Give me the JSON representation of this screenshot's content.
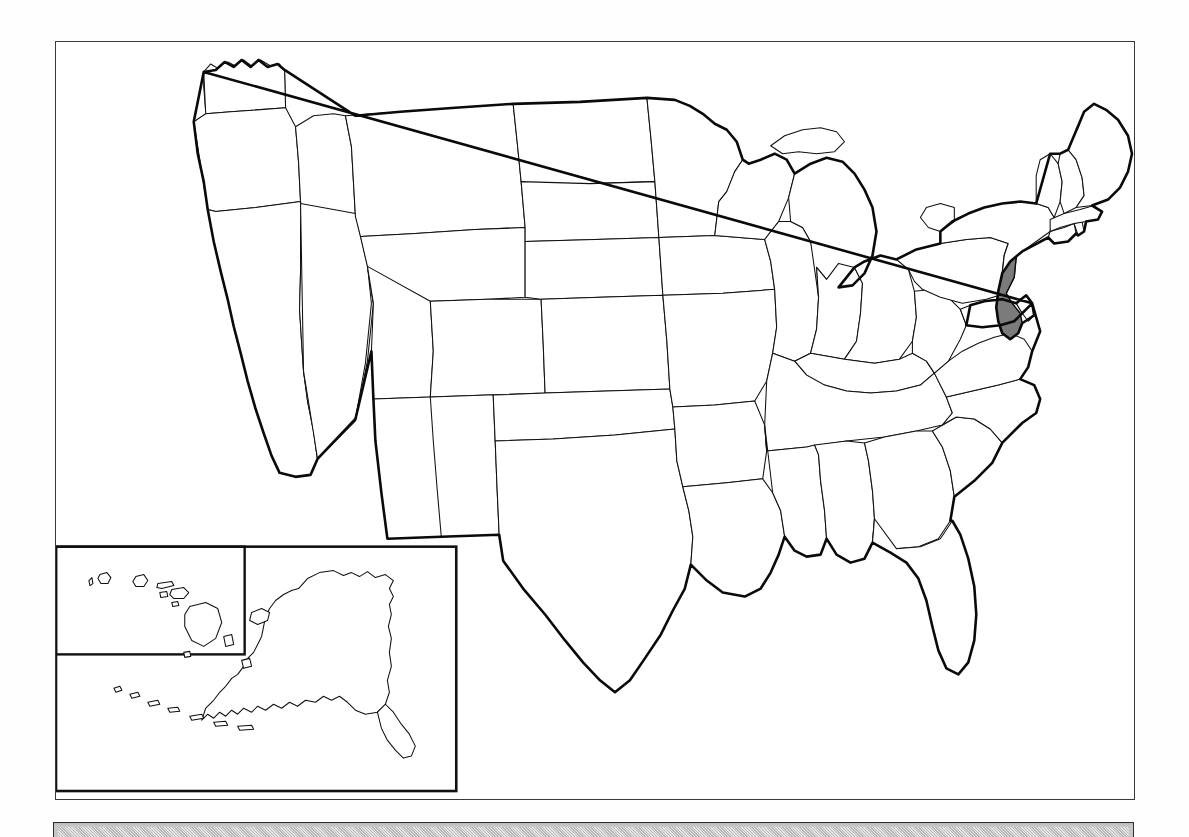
{
  "document": {
    "type": "outline-map",
    "title": "United States Outline Map",
    "subject": "New Jersey",
    "background_color": "#fefefe"
  },
  "map": {
    "frame": {
      "border_color": "#3a3a3a",
      "fill_color": "#ffffff"
    },
    "outline_color": "#0a0a0a",
    "state_fill_color": "#ffffff",
    "highlight_color": "#7b7b7b",
    "highlighted_states": [
      "New Jersey"
    ],
    "projection_note": "contiguous 48 states with Alaska and Hawaii inset",
    "regions": [
      {
        "id": "WA",
        "name": "Washington",
        "highlighted": false
      },
      {
        "id": "OR",
        "name": "Oregon",
        "highlighted": false
      },
      {
        "id": "CA",
        "name": "California",
        "highlighted": false
      },
      {
        "id": "ID",
        "name": "Idaho",
        "highlighted": false
      },
      {
        "id": "NV",
        "name": "Nevada",
        "highlighted": false
      },
      {
        "id": "MT",
        "name": "Montana",
        "highlighted": false
      },
      {
        "id": "WY",
        "name": "Wyoming",
        "highlighted": false
      },
      {
        "id": "UT",
        "name": "Utah",
        "highlighted": false
      },
      {
        "id": "AZ",
        "name": "Arizona",
        "highlighted": false
      },
      {
        "id": "CO",
        "name": "Colorado",
        "highlighted": false
      },
      {
        "id": "NM",
        "name": "New Mexico",
        "highlighted": false
      },
      {
        "id": "ND",
        "name": "North Dakota",
        "highlighted": false
      },
      {
        "id": "SD",
        "name": "South Dakota",
        "highlighted": false
      },
      {
        "id": "NE",
        "name": "Nebraska",
        "highlighted": false
      },
      {
        "id": "KS",
        "name": "Kansas",
        "highlighted": false
      },
      {
        "id": "OK",
        "name": "Oklahoma",
        "highlighted": false
      },
      {
        "id": "TX",
        "name": "Texas",
        "highlighted": false
      },
      {
        "id": "MN",
        "name": "Minnesota",
        "highlighted": false
      },
      {
        "id": "IA",
        "name": "Iowa",
        "highlighted": false
      },
      {
        "id": "MO",
        "name": "Missouri",
        "highlighted": false
      },
      {
        "id": "AR",
        "name": "Arkansas",
        "highlighted": false
      },
      {
        "id": "LA",
        "name": "Louisiana",
        "highlighted": false
      },
      {
        "id": "WI",
        "name": "Wisconsin",
        "highlighted": false
      },
      {
        "id": "IL",
        "name": "Illinois",
        "highlighted": false
      },
      {
        "id": "MI",
        "name": "Michigan",
        "highlighted": false
      },
      {
        "id": "IN",
        "name": "Indiana",
        "highlighted": false
      },
      {
        "id": "OH",
        "name": "Ohio",
        "highlighted": false
      },
      {
        "id": "KY",
        "name": "Kentucky",
        "highlighted": false
      },
      {
        "id": "TN",
        "name": "Tennessee",
        "highlighted": false
      },
      {
        "id": "MS",
        "name": "Mississippi",
        "highlighted": false
      },
      {
        "id": "AL",
        "name": "Alabama",
        "highlighted": false
      },
      {
        "id": "GA",
        "name": "Georgia",
        "highlighted": false
      },
      {
        "id": "FL",
        "name": "Florida",
        "highlighted": false
      },
      {
        "id": "SC",
        "name": "South Carolina",
        "highlighted": false
      },
      {
        "id": "NC",
        "name": "North Carolina",
        "highlighted": false
      },
      {
        "id": "VA",
        "name": "Virginia",
        "highlighted": false
      },
      {
        "id": "WV",
        "name": "West Virginia",
        "highlighted": false
      },
      {
        "id": "MD",
        "name": "Maryland",
        "highlighted": false
      },
      {
        "id": "DE",
        "name": "Delaware",
        "highlighted": false
      },
      {
        "id": "PA",
        "name": "Pennsylvania",
        "highlighted": false
      },
      {
        "id": "NJ",
        "name": "New Jersey",
        "highlighted": true
      },
      {
        "id": "NY",
        "name": "New York",
        "highlighted": false
      },
      {
        "id": "CT",
        "name": "Connecticut",
        "highlighted": false
      },
      {
        "id": "RI",
        "name": "Rhode Island",
        "highlighted": false
      },
      {
        "id": "MA",
        "name": "Massachusetts",
        "highlighted": false
      },
      {
        "id": "VT",
        "name": "Vermont",
        "highlighted": false
      },
      {
        "id": "NH",
        "name": "New Hampshire",
        "highlighted": false
      },
      {
        "id": "ME",
        "name": "Maine",
        "highlighted": false
      },
      {
        "id": "AK",
        "name": "Alaska",
        "highlighted": false
      },
      {
        "id": "HI",
        "name": "Hawaii",
        "highlighted": false
      }
    ],
    "inset": {
      "name": "alaska-hawaii-inset",
      "border_color": "#111111",
      "sub_box_name": "hawaii-inset"
    }
  },
  "bottom_bar": {
    "name": "gray-panel",
    "fill_color": "#c8c8c8",
    "border_color": "#2e2e2e",
    "label": ""
  }
}
